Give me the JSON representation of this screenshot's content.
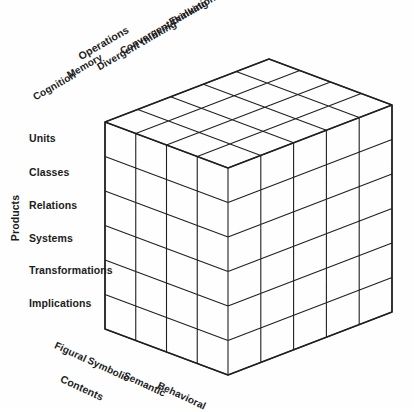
{
  "diagram": {
    "name": "Structure of Intellect model cube",
    "background_color": "#fefefe",
    "line_color": "#231f20",
    "text_color": "#1c1c1c"
  },
  "axes": {
    "operations": {
      "title": "Operations",
      "categories": [
        "Cognition",
        "Memory",
        "Divergent thinking",
        "Convergent thinking",
        "Evaluation"
      ],
      "count": 5
    },
    "products": {
      "title": "Products",
      "categories": [
        "Units",
        "Classes",
        "Relations",
        "Systems",
        "Transformations",
        "Implications"
      ],
      "count": 6
    },
    "contents": {
      "title": "Contents",
      "categories": [
        "Figural",
        "Symbolic",
        "Semantic",
        "Behavioral"
      ],
      "count": 4
    }
  },
  "geometry": {
    "front_top": [
      228,
      168
    ],
    "front_bottom": [
      228,
      375
    ],
    "left_top": [
      105,
      122
    ],
    "left_bottom": [
      105,
      330
    ],
    "right_top": [
      392,
      105
    ],
    "right_bottom": [
      392,
      312
    ],
    "back_top": [
      268,
      44
    ]
  },
  "labels": {
    "operations_title": {
      "x": 79,
      "y": 57,
      "rotate": -30
    },
    "operations_cats": [
      {
        "text": "Cognition",
        "x": 34,
        "y": 98,
        "rotate": -30
      },
      {
        "text": "Memory",
        "x": 68,
        "y": 76,
        "rotate": -30
      },
      {
        "text": "Divergent thinking",
        "x": 98,
        "y": 68,
        "rotate": -30
      },
      {
        "text": "Convergent thinking",
        "x": 121,
        "y": 52,
        "rotate": -30
      },
      {
        "text": "Evaluation",
        "x": 170,
        "y": 23,
        "rotate": -30
      }
    ],
    "products_title": {
      "x": 15,
      "y": 218
    },
    "products_cats": [
      {
        "text": "Units",
        "x": 29,
        "y": 138
      },
      {
        "text": "Classes",
        "x": 29,
        "y": 172
      },
      {
        "text": "Relations",
        "x": 29,
        "y": 205
      },
      {
        "text": "Systems",
        "x": 29,
        "y": 238
      },
      {
        "text": "Transformations",
        "x": 29,
        "y": 270
      },
      {
        "text": "Implications",
        "x": 29,
        "y": 303
      }
    ],
    "contents_title": {
      "x": 61,
      "y": 378,
      "rotate": 25
    },
    "contents_cats": [
      {
        "text": "Figural",
        "x": 55,
        "y": 345,
        "rotate": 25
      },
      {
        "text": "Symbolic",
        "x": 88,
        "y": 360,
        "rotate": 25
      },
      {
        "text": "Semantic",
        "x": 124,
        "y": 375,
        "rotate": 25
      },
      {
        "text": "Behavioral",
        "x": 158,
        "y": 385,
        "rotate": 25
      }
    ]
  }
}
